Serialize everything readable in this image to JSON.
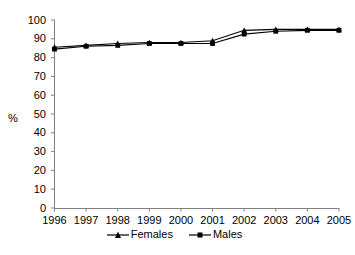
{
  "chart_data": {
    "type": "line",
    "title": "",
    "subtitle": "",
    "xlabel": "",
    "ylabel": "%",
    "categories": [
      "1996",
      "1997",
      "1998",
      "1999",
      "2000",
      "2001",
      "2002",
      "2003",
      "2004",
      "2005"
    ],
    "x": [
      1996,
      1997,
      1998,
      1999,
      2000,
      2001,
      2002,
      2003,
      2004,
      2005
    ],
    "series": [
      {
        "name": "Females",
        "marker": "triangle",
        "color": "#000000",
        "values": [
          85.5,
          86.5,
          87.5,
          88,
          88,
          89,
          94.5,
          95,
          95,
          95
        ]
      },
      {
        "name": "Males",
        "marker": "square",
        "color": "#000000",
        "values": [
          84.5,
          86,
          86.5,
          87.5,
          87.5,
          87.5,
          92.5,
          94,
          94.5,
          94.5
        ]
      }
    ],
    "ylim": [
      0,
      100
    ],
    "ytick_values": [
      0,
      10,
      20,
      30,
      40,
      50,
      60,
      70,
      80,
      90,
      100
    ],
    "ytick_labels": [
      "0",
      "10",
      "20",
      "30",
      "40",
      "50",
      "60",
      "70",
      "80",
      "90",
      "100"
    ],
    "xtick_labels": [
      "1996",
      "1997",
      "1998",
      "1999",
      "2000",
      "2001",
      "2002",
      "2003",
      "2004",
      "2005"
    ],
    "grid": false,
    "legend_position": "bottom",
    "legend": [
      "Females",
      "Males"
    ],
    "annotations": []
  },
  "axis": {
    "y_title": "%"
  },
  "legend": {
    "items": [
      {
        "label": "Females",
        "marker": "triangle-marker"
      },
      {
        "label": "Males",
        "marker": "square-marker"
      }
    ]
  }
}
